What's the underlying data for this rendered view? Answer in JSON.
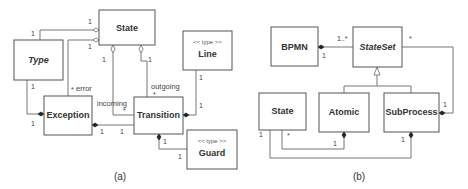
{
  "diagram_a": {
    "caption": "(a)",
    "classes": {
      "state": {
        "name": "State"
      },
      "type": {
        "name": "Type"
      },
      "line": {
        "name": "Line",
        "stereotype": "<< type >>"
      },
      "exception": {
        "name": "Exception"
      },
      "transition": {
        "name": "Transition"
      },
      "guard": {
        "name": "Guard",
        "stereotype": "<< type >>"
      }
    },
    "labels": {
      "state_type_state_end": "1",
      "state_type_type_end": "1",
      "state_exception_state_end": "1",
      "state_exception_role": "error",
      "state_exception_mult": "*",
      "state_incoming_state_end": "1",
      "incoming_role": "incoming",
      "incoming_mult": "*",
      "state_outgoing_state_end": "1",
      "outgoing_role": "outgoing",
      "outgoing_mult": "*",
      "type_exception_type_end": "1",
      "type_exception_exception_end": "1",
      "exception_transition_exception_end": "1",
      "exception_transition_transition_end": "1",
      "line_transition_line_end": "1",
      "line_transition_transition_end": "1",
      "transition_guard_transition_end": "1",
      "transition_guard_guard_end": "1"
    }
  },
  "diagram_b": {
    "caption": "(b)",
    "classes": {
      "bpmn": {
        "name": "BPMN"
      },
      "stateset": {
        "name": "StateSet"
      },
      "state": {
        "name": "State"
      },
      "atomic": {
        "name": "Atomic"
      },
      "subprocess": {
        "name": "SubProcess"
      }
    },
    "labels": {
      "bpmn_stateset_stateset_end": "1..*",
      "bpmn_stateset_bpmn_end": "1",
      "stateset_subprocess_stateset_end": "*",
      "stateset_subprocess_subprocess_end": "1",
      "state_atomic_state_end": "*",
      "state_atomic_atomic_end": "1",
      "state_subprocess_state_end": "1",
      "state_subprocess_subprocess_end": "1"
    }
  }
}
